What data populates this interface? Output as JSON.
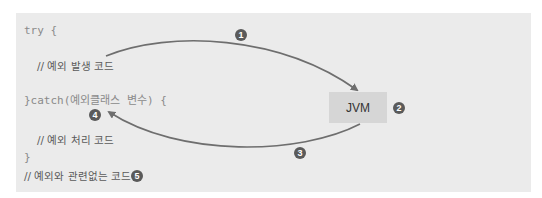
{
  "code": {
    "try_line": "try {",
    "exception_comment": "// 예외 발생 코드",
    "catch_line": "}catch(예외클래스 변수) {",
    "handling_comment": "// 예외 처리 코드",
    "close_brace": "}",
    "unrelated_comment": "// 예외와 관련없는 코드"
  },
  "jvm": {
    "label": "JVM"
  },
  "markers": {
    "m1": "1",
    "m2": "2",
    "m3": "3",
    "m4": "4",
    "m5": "5"
  },
  "colors": {
    "panel_bg": "#ebebeb",
    "jvm_box_bg": "#d6d6d6",
    "arrow": "#6e6e6e",
    "marker_bg": "#5a5a5a"
  }
}
